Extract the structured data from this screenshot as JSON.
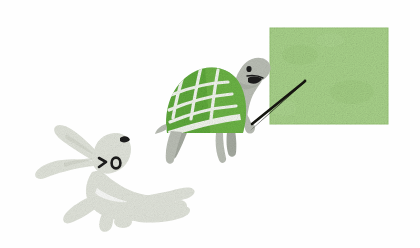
{
  "illustration": {
    "title": "Tortoise with pointer at a green board and a running hare",
    "style": "hand-drawn grainy crayon texture",
    "background_color": "#fefefe",
    "canvas": {
      "width": 420,
      "height": 248
    }
  },
  "board": {
    "name": "presentation-board",
    "label": "",
    "content_text": "",
    "fill_color": "#a8d18a",
    "edge_color": "#9ac779",
    "x": 270,
    "y": 28,
    "width": 118,
    "height": 96
  },
  "turtle": {
    "name": "turtle-presenter",
    "shell_color": "#5faa3c",
    "shell_highlight_color": "#76bb4f",
    "shell_pattern_color": "#f2f6ee",
    "body_color": "#b9bdb4",
    "body_shadow_color": "#a4a99f",
    "eye_color": "#1b1b1b",
    "mouth_color": "#1b1b1b",
    "pointer_color": "#15150f",
    "expression": "smiling",
    "pose": "standing and pointing at board",
    "shell_grid_lines": 6,
    "legs": 4
  },
  "hare": {
    "name": "running-hare",
    "body_color": "#dfe2d9",
    "body_shadow_color": "#cfd3c8",
    "outline_color": "#c6cbbe",
    "eye_open_color": "#1b1b1b",
    "eye_squint_color": "#1b1b1b",
    "nose_color": "#1b1b1b",
    "pose": "leaping to the left",
    "ears": 2,
    "eye_left_glyph": ">",
    "eye_right_glyph": "o"
  },
  "pointer": {
    "name": "pointer-stick",
    "color": "#15150f",
    "tip_x": 304,
    "tip_y": 82,
    "base_x": 252,
    "base_y": 124
  }
}
